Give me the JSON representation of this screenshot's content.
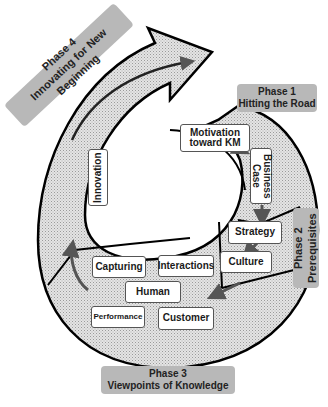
{
  "phases": [
    {
      "id": 1,
      "label": "Phase 1",
      "title": "Hitting the Road"
    },
    {
      "id": 2,
      "label": "Phase 2",
      "title": "Prerequisites"
    },
    {
      "id": 3,
      "label": "Phase 3",
      "title": "Viewpoints of Knowledge"
    },
    {
      "id": 4,
      "label": "Phase 4",
      "title": "Innovating for New Beginning"
    }
  ],
  "nodes": {
    "motivation": "Motivation toward KM",
    "business_case": "Business Case",
    "strategy": "Strategy",
    "culture": "Culture",
    "capturing": "Capturing",
    "interactions": "Interactions",
    "human": "Human",
    "performance": "Performance",
    "customer": "Customer",
    "innovation": "Innovation"
  },
  "colors": {
    "phase_label_bg": "#b8b8b8",
    "band_fill": "#d9d9d9",
    "arrow": "#555555",
    "outline": "#000000"
  }
}
